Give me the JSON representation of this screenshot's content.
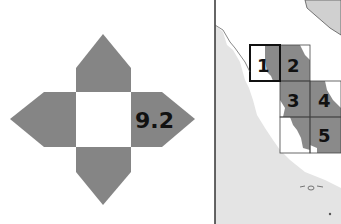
{
  "left_diagram": {
    "description": "Cross-shaped stencil with white center square and four gray arrow arms",
    "label": "9.2",
    "colors": {
      "arm": "#858585",
      "center": "#ffffff",
      "text": "#111111"
    }
  },
  "map": {
    "grid_cells": [
      {
        "id": "1",
        "label": "1",
        "highlighted": true
      },
      {
        "id": "2",
        "label": "2",
        "highlighted": false
      },
      {
        "id": "3",
        "label": "3",
        "highlighted": false
      },
      {
        "id": "4",
        "label": "4",
        "highlighted": false
      },
      {
        "id": "5",
        "label": "5",
        "highlighted": false
      }
    ],
    "colors": {
      "land": "#e4e4e4",
      "sea": "#ffffff",
      "shaded": "#8a8a8a",
      "frame": "#333333"
    }
  }
}
